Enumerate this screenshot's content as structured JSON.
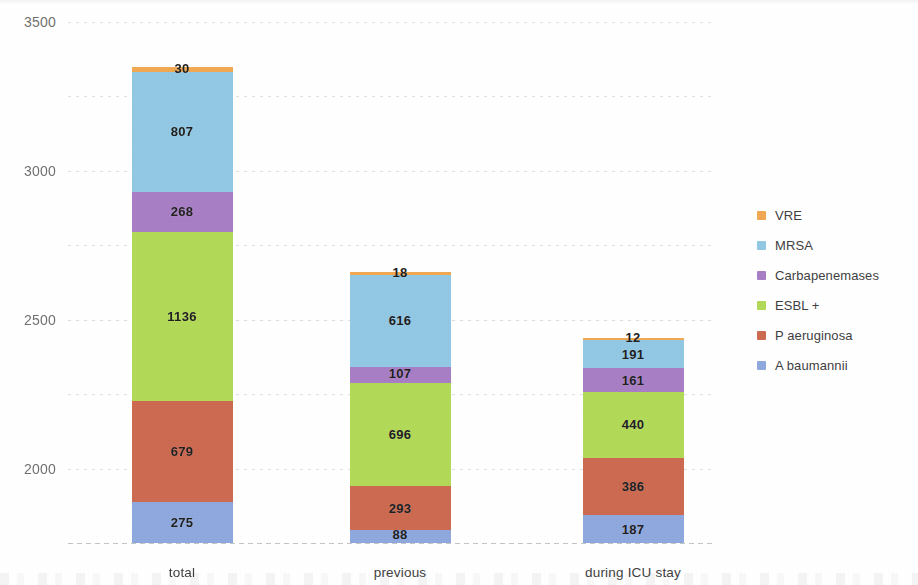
{
  "chart_data": {
    "type": "bar",
    "stacked": true,
    "title": "",
    "xlabel": "",
    "ylabel": "",
    "categories": [
      "total",
      "previous",
      "during ICU stay"
    ],
    "ylim": [
      0,
      3500
    ],
    "yticks": [
      0,
      500,
      1000,
      1500,
      2000,
      2500,
      3000,
      3500
    ],
    "ytick_labels": [
      "0",
      "500",
      "1000",
      "1500",
      "2000",
      "2500",
      "3000",
      "3500"
    ],
    "grid": true,
    "legend_position": "right",
    "series": [
      {
        "name": "A baumannii",
        "color": "#8fa8dd",
        "values": [
          275,
          88,
          187
        ]
      },
      {
        "name": "P aeruginosa",
        "color": "#cc6a52",
        "values": [
          679,
          293,
          386
        ]
      },
      {
        "name": "ESBL +",
        "color": "#b3d959",
        "values": [
          1136,
          696,
          440
        ]
      },
      {
        "name": "Carbapenemases",
        "color": "#a87fc4",
        "values": [
          268,
          107,
          161
        ]
      },
      {
        "name": "MRSA",
        "color": "#92c8e3",
        "values": [
          807,
          616,
          191
        ]
      },
      {
        "name": "VRE",
        "color": "#f0a852",
        "values": [
          30,
          18,
          12
        ]
      }
    ],
    "legend_order": [
      "VRE",
      "MRSA",
      "Carbapenemases",
      "ESBL +",
      "P aeruginosa",
      "A baumannii"
    ],
    "totals": [
      3195,
      1818,
      1377
    ]
  }
}
